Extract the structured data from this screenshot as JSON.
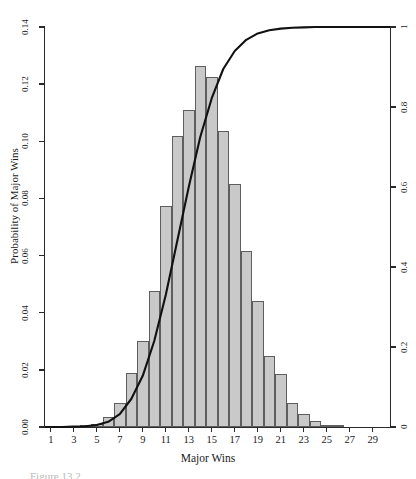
{
  "figure": {
    "xlabel": "Major Wins",
    "ylabel_left": "Probability of Major Wins",
    "caption_fragment": "Figure 13.2"
  },
  "chart_data": {
    "type": "bar",
    "title": "",
    "xlabel": "Major Wins",
    "ylabel": "Probability of Major Wins",
    "ylabel_right": "",
    "xlim": [
      0.5,
      30.5
    ],
    "ylim": [
      0,
      0.14
    ],
    "ylim_right": [
      0,
      1
    ],
    "grid": false,
    "legend": null,
    "xtick_labels": [
      "1",
      "3",
      "5",
      "7",
      "9",
      "11",
      "13",
      "15",
      "17",
      "19",
      "21",
      "23",
      "25",
      "27",
      "29"
    ],
    "xtick_values": [
      1,
      3,
      5,
      7,
      9,
      11,
      13,
      15,
      17,
      19,
      21,
      23,
      25,
      27,
      29
    ],
    "ytick_labels": [
      "0.00",
      "0.02",
      "0.04",
      "0.06",
      "0.08",
      "0.10",
      "0.12",
      "0.14"
    ],
    "ytick_values": [
      0.0,
      0.02,
      0.04,
      0.06,
      0.08,
      0.1,
      0.12,
      0.14
    ],
    "ytick_labels_right": [
      "0",
      "0.2",
      "0.4",
      "0.6",
      "0.8",
      "1"
    ],
    "ytick_values_right": [
      0,
      0.2,
      0.4,
      0.6,
      0.8,
      1
    ],
    "categories": [
      1,
      2,
      3,
      4,
      5,
      6,
      7,
      8,
      9,
      10,
      11,
      12,
      13,
      14,
      15,
      16,
      17,
      18,
      19,
      20,
      21,
      22,
      23,
      24,
      25,
      26,
      27,
      28,
      29,
      30
    ],
    "series": [
      {
        "name": "Probability of Major Wins",
        "kind": "bar",
        "axis": "left",
        "values": [
          0.0,
          0.0,
          0.0001,
          0.0004,
          0.0012,
          0.0035,
          0.0085,
          0.0188,
          0.03,
          0.0475,
          0.0775,
          0.102,
          0.111,
          0.1265,
          0.1225,
          0.1035,
          0.085,
          0.0615,
          0.044,
          0.025,
          0.0185,
          0.0085,
          0.0045,
          0.002,
          0.0008,
          0.0003,
          0.0001,
          0.0,
          0.0,
          0.0
        ]
      },
      {
        "name": "Cumulative Probability",
        "kind": "line",
        "axis": "right",
        "values": [
          0.0,
          0.0,
          0.001,
          0.002,
          0.005,
          0.013,
          0.032,
          0.07,
          0.128,
          0.215,
          0.33,
          0.465,
          0.6,
          0.725,
          0.822,
          0.895,
          0.94,
          0.968,
          0.984,
          0.992,
          0.996,
          0.998,
          0.999,
          1.0,
          1.0,
          1.0,
          1.0,
          1.0,
          1.0,
          1.0
        ]
      }
    ]
  }
}
